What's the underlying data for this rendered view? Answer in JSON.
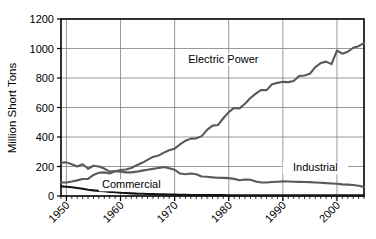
{
  "chart_data": {
    "type": "line",
    "title": "",
    "xlabel": "",
    "ylabel": "Million Short Tons",
    "xlim": [
      1949,
      2005
    ],
    "ylim": [
      0,
      1200
    ],
    "grid": true,
    "legend_position": "inline-annotations",
    "y_ticks": [
      0,
      200,
      400,
      600,
      800,
      1000,
      1200
    ],
    "x_ticks": [
      1950,
      1960,
      1970,
      1980,
      1990,
      2000
    ],
    "x_tick_labels": [
      "1950",
      "1960",
      "1970",
      "1980",
      "1990",
      "2000"
    ],
    "y_tick_labels": [
      "0",
      "200",
      "400",
      "600",
      "800",
      "1000",
      "1200"
    ],
    "x_minor_tick_interval": 1,
    "x": [
      1949,
      1950,
      1951,
      1952,
      1953,
      1954,
      1955,
      1956,
      1957,
      1958,
      1959,
      1960,
      1961,
      1962,
      1963,
      1964,
      1965,
      1966,
      1967,
      1968,
      1969,
      1970,
      1971,
      1972,
      1973,
      1974,
      1975,
      1976,
      1977,
      1978,
      1979,
      1980,
      1981,
      1982,
      1983,
      1984,
      1985,
      1986,
      1987,
      1988,
      1989,
      1990,
      1991,
      1992,
      1993,
      1994,
      1995,
      1996,
      1997,
      1998,
      1999,
      2000,
      2001,
      2002,
      2003,
      2004,
      2005
    ],
    "series": [
      {
        "name": "Electric Power",
        "color": "#595959",
        "label_text": "Electric Power",
        "label_x": 1979,
        "label_y": 905,
        "values": [
          92,
          92,
          98,
          106,
          115,
          116,
          143,
          158,
          160,
          153,
          167,
          176,
          180,
          190,
          209,
          225,
          245,
          265,
          274,
          294,
          310,
          321,
          350,
          375,
          389,
          391,
          406,
          448,
          477,
          481,
          527,
          569,
          597,
          594,
          625,
          664,
          694,
          719,
          718,
          758,
          767,
          774,
          772,
          780,
          813,
          817,
          829,
          874,
          901,
          911,
          894,
          986,
          965,
          978,
          1005,
          1016,
          1037
        ]
      },
      {
        "name": "Industrial",
        "color": "#595959",
        "label_text": "Industrial",
        "label_x": 1996,
        "label_y": 168,
        "values": [
          225,
          228,
          215,
          200,
          215,
          185,
          205,
          200,
          186,
          165,
          170,
          165,
          160,
          160,
          165,
          172,
          178,
          184,
          190,
          196,
          188,
          178,
          152,
          148,
          153,
          148,
          132,
          130,
          126,
          124,
          123,
          121,
          116,
          107,
          112,
          110,
          98,
          92,
          92,
          95,
          97,
          99,
          98,
          97,
          96,
          95,
          94,
          92,
          90,
          87,
          85,
          83,
          79,
          77,
          75,
          70,
          62
        ]
      },
      {
        "name": "Commercial",
        "color": "#141414",
        "label_text": "Commercial",
        "label_x": 1962,
        "label_y": 52,
        "values": [
          65,
          63,
          59,
          54,
          49,
          42,
          38,
          35,
          33,
          28,
          25,
          22,
          20,
          18,
          16,
          15,
          14,
          13,
          12,
          11,
          10,
          9,
          8,
          8,
          7,
          7,
          6,
          6,
          6,
          6,
          6,
          5,
          5,
          5,
          5,
          5,
          5,
          5,
          5,
          5,
          5,
          5,
          5,
          5,
          5,
          5,
          5,
          5,
          4,
          4,
          4,
          4,
          4,
          4,
          4,
          4,
          4
        ]
      }
    ]
  },
  "axes": {
    "plot_left": 61,
    "plot_right": 364,
    "plot_top": 19,
    "plot_bottom": 196,
    "border_color": "#000000",
    "grid_color": "#808080"
  }
}
